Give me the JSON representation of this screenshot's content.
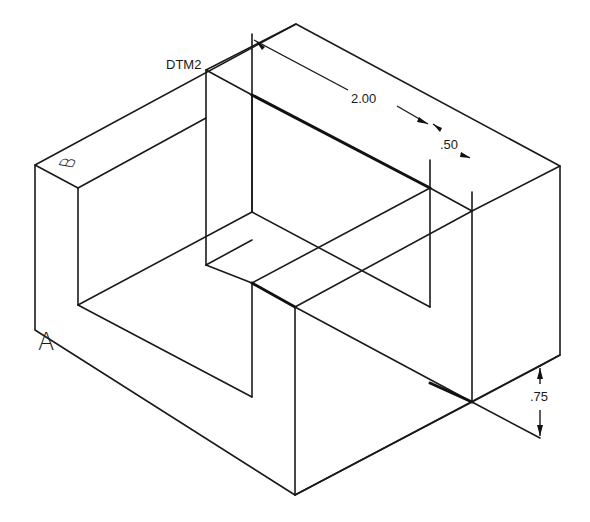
{
  "drawing": {
    "type": "isometric-part-drawing",
    "line_color": "#1a1a1a",
    "background": "#ffffff",
    "datum_label": "DTM2",
    "face_labels": [
      {
        "id": "A",
        "text": "A"
      },
      {
        "id": "B",
        "text": "B"
      }
    ],
    "dimensions": [
      {
        "id": "dim-length",
        "text": "2.00"
      },
      {
        "id": "dim-offset",
        "text": ".50"
      },
      {
        "id": "dim-height",
        "text": ".75"
      }
    ]
  }
}
